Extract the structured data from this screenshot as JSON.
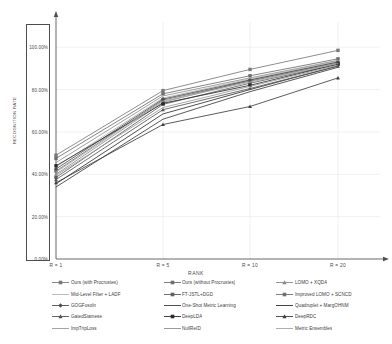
{
  "chart_data": {
    "type": "line",
    "title": "",
    "xlabel": "RANK",
    "ylabel": "RECOGNITION RATE",
    "categories": [
      "R = 1",
      "R = 5",
      "R = 10",
      "R = 20"
    ],
    "x": [
      1,
      5,
      10,
      20
    ],
    "ylim": [
      0,
      110
    ],
    "yticks": [
      0,
      20,
      40,
      60,
      80,
      100
    ],
    "ytick_labels": [
      "0.00%",
      "20.00%",
      "40.00%",
      "60.00%",
      "80.00%",
      "100.00%"
    ],
    "grid": true,
    "legend_position": "bottom",
    "legend_columns": 3,
    "series": [
      {
        "name": "Ours (with Procrustes)",
        "values": [
          49.0,
          79.5,
          89.5,
          98.5
        ],
        "color": "#7a7a7a",
        "marker": "square"
      },
      {
        "name": "Ours (without Procrustes)",
        "values": [
          47.5,
          78.0,
          86.5,
          94.5
        ],
        "color": "#6e6e6e",
        "marker": "square"
      },
      {
        "name": "LOMO + XQDA",
        "values": [
          40.0,
          74.0,
          84.5,
          93.0
        ],
        "color": "#8a8a8a",
        "marker": "triangle"
      },
      {
        "name": "Mid-Level Filter + LADF",
        "values": [
          43.5,
          76.0,
          85.0,
          93.5
        ],
        "color": "#b4b4b4",
        "marker": "none"
      },
      {
        "name": "FT-JSTL+DGD",
        "values": [
          38.5,
          73.0,
          83.0,
          92.0
        ],
        "color": "#5f5f5f",
        "marker": "square"
      },
      {
        "name": "Improved LOMO + SCNCD",
        "values": [
          41.5,
          75.0,
          84.0,
          92.5
        ],
        "color": "#707070",
        "marker": "square"
      },
      {
        "name": "GOGFusoIn",
        "values": [
          42.5,
          75.5,
          84.5,
          93.0
        ],
        "color": "#4f4f4f",
        "marker": "diamond"
      },
      {
        "name": "One-Shot Metric Learning",
        "values": [
          34.0,
          66.0,
          79.0,
          90.5
        ],
        "color": "#3c3c3c",
        "marker": "none"
      },
      {
        "name": "Quadruplet + MargOHNM",
        "values": "",
        "color": "#2f2f2f",
        "marker": "none"
      },
      {
        "name": "GatedSiamese",
        "values": [
          37.5,
          70.5,
          80.5,
          91.0
        ],
        "color": "#555555",
        "marker": "triangle"
      },
      {
        "name": "DeepLDA",
        "values": [
          44.0,
          73.5,
          82.0,
          92.0
        ],
        "color": "#2b2b2b",
        "marker": "square"
      },
      {
        "name": "DeepRDC",
        "values": [
          36.0,
          63.5,
          72.0,
          85.5
        ],
        "color": "#3f3f3f",
        "marker": "triangle"
      },
      {
        "name": "ImpTripLoss",
        "values": [
          39.5,
          71.5,
          81.5,
          91.5
        ],
        "color": "#9a9a9a",
        "marker": "none"
      },
      {
        "name": "NullReID",
        "values": [
          45.5,
          77.0,
          85.5,
          93.8
        ],
        "color": "#8f8f8f",
        "marker": "none"
      },
      {
        "name": "Metric Ensembles",
        "values": [
          41.0,
          74.5,
          83.5,
          92.3
        ],
        "color": "#a5a5a5",
        "marker": "none"
      }
    ],
    "series_values": [
      [
        49.0,
        79.5,
        89.5,
        98.5
      ],
      [
        47.5,
        78.0,
        86.5,
        94.5
      ],
      [
        40.0,
        74.0,
        84.5,
        93.0
      ],
      [
        43.5,
        76.0,
        85.0,
        93.5
      ],
      [
        38.5,
        73.0,
        83.0,
        92.0
      ],
      [
        41.5,
        75.0,
        84.0,
        92.5
      ],
      [
        42.5,
        75.5,
        84.5,
        93.0
      ],
      [
        34.0,
        66.0,
        79.0,
        90.5
      ],
      [
        35.5,
        68.5,
        80.0,
        91.2
      ],
      [
        37.5,
        70.5,
        80.5,
        91.0
      ],
      [
        44.0,
        73.5,
        82.0,
        92.0
      ],
      [
        36.0,
        63.5,
        72.0,
        85.5
      ],
      [
        39.5,
        71.5,
        81.5,
        91.5
      ],
      [
        45.5,
        77.0,
        85.5,
        93.8
      ],
      [
        41.0,
        74.5,
        83.5,
        92.3
      ]
    ]
  },
  "axes": {
    "y_title": "RECOGNITION RATE",
    "x_title": "RANK",
    "y_tick_labels": [
      "100.00%",
      "80.00%",
      "60.00%",
      "40.00%",
      "20.00%",
      "0.00%"
    ],
    "x_tick_labels": [
      "R = 1",
      "R = 5",
      "R = 10",
      "R = 20"
    ]
  },
  "legend": {
    "items": [
      {
        "label": "Ours (with Procrustes)",
        "marker": "square",
        "color": "#7a7a7a"
      },
      {
        "label": "Ours (without Procrustes)",
        "marker": "square",
        "color": "#6e6e6e"
      },
      {
        "label": "LOMO + XQDA",
        "marker": "triangle",
        "color": "#8a8a8a"
      },
      {
        "label": "Mid-Level Filter + LADF",
        "marker": "none",
        "color": "#b4b4b4"
      },
      {
        "label": "FT-JSTL+DGD",
        "marker": "square",
        "color": "#5f5f5f"
      },
      {
        "label": "Improved LOMO + SCNCD",
        "marker": "square",
        "color": "#707070"
      },
      {
        "label": "GOGFusoIn",
        "marker": "diamond",
        "color": "#4f4f4f"
      },
      {
        "label": "One-Shot Metric Learning",
        "marker": "none",
        "color": "#3c3c3c"
      },
      {
        "label": "Quadruplet + MargOHNM",
        "marker": "none",
        "color": "#2f2f2f"
      },
      {
        "label": "GatedSiamese",
        "marker": "triangle",
        "color": "#555555"
      },
      {
        "label": "DeepLDA",
        "marker": "square",
        "color": "#2b2b2b"
      },
      {
        "label": "DeepRDC",
        "marker": "triangle",
        "color": "#3f3f3f"
      },
      {
        "label": "ImpTripLoss",
        "marker": "none",
        "color": "#9a9a9a"
      },
      {
        "label": "NullReID",
        "marker": "none",
        "color": "#8f8f8f"
      },
      {
        "label": "Metric Ensembles",
        "marker": "none",
        "color": "#a5a5a5"
      }
    ]
  },
  "colors": {
    "axis": "#4d4d4d",
    "grid": "#e2e2e2",
    "background": "#ffffff",
    "text": "#4a4a4a"
  }
}
